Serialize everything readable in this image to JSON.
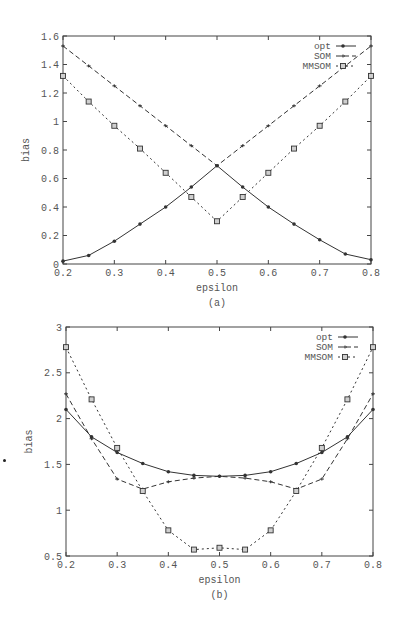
{
  "chart_data": [
    {
      "type": "line",
      "panel": "a",
      "caption": "(a)",
      "title": "",
      "xlabel": "epsilon",
      "ylabel": "bias",
      "xlim": [
        0.2,
        0.8
      ],
      "ylim": [
        0,
        1.6
      ],
      "xticks": [
        0.2,
        0.3,
        0.4,
        0.5,
        0.6,
        0.7,
        0.8
      ],
      "xtick_labels": [
        "0.2",
        "0.3",
        "0.4",
        "0.5",
        "0.6",
        "0.7",
        "0.8"
      ],
      "yticks": [
        0,
        0.2,
        0.4,
        0.6,
        0.8,
        1,
        1.2,
        1.4,
        1.6
      ],
      "ytick_labels": [
        "0",
        "0.2",
        "0.4",
        "0.6",
        "0.8",
        "1",
        "1.2",
        "1.4",
        "1.6"
      ],
      "grid": false,
      "legend_position": "upper right",
      "frame": {
        "left": 63,
        "right": 371,
        "top": 36,
        "bottom": 264
      },
      "x": [
        0.2,
        0.25,
        0.3,
        0.35,
        0.4,
        0.45,
        0.5,
        0.55,
        0.6,
        0.65,
        0.7,
        0.75,
        0.8
      ],
      "series": [
        {
          "name": "opt",
          "style": "solid",
          "marker": "dot",
          "values": [
            0.02,
            0.06,
            0.16,
            0.28,
            0.4,
            0.54,
            0.69,
            0.54,
            0.4,
            0.28,
            0.17,
            0.07,
            0.03
          ]
        },
        {
          "name": "SOM",
          "style": "dashed",
          "marker": "plus",
          "values": [
            1.53,
            1.39,
            1.25,
            1.11,
            0.97,
            0.83,
            0.69,
            0.83,
            0.97,
            1.11,
            1.25,
            1.39,
            1.53
          ]
        },
        {
          "name": "MMSOM",
          "style": "dotted",
          "marker": "square",
          "values": [
            1.32,
            1.14,
            0.97,
            0.81,
            0.64,
            0.47,
            0.3,
            0.47,
            0.64,
            0.81,
            0.97,
            1.14,
            1.32
          ]
        }
      ]
    },
    {
      "type": "line",
      "panel": "b",
      "caption": "(b)",
      "title": "",
      "xlabel": "epsilon",
      "ylabel": "bias",
      "xlim": [
        0.2,
        0.8
      ],
      "ylim": [
        0.5,
        3
      ],
      "xticks": [
        0.2,
        0.3,
        0.4,
        0.5,
        0.6,
        0.7,
        0.8
      ],
      "xtick_labels": [
        "0.2",
        "0.3",
        "0.4",
        "0.5",
        "0.6",
        "0.7",
        "0.8"
      ],
      "yticks": [
        0.5,
        1,
        1.5,
        2,
        2.5,
        3
      ],
      "ytick_labels": [
        "0.5",
        "1",
        "1.5",
        "2",
        "2.5",
        "3"
      ],
      "grid": false,
      "legend_position": "upper right",
      "frame": {
        "left": 66,
        "right": 373,
        "top": 327,
        "bottom": 556
      },
      "x": [
        0.2,
        0.25,
        0.3,
        0.35,
        0.4,
        0.45,
        0.5,
        0.55,
        0.6,
        0.65,
        0.7,
        0.75,
        0.8
      ],
      "series": [
        {
          "name": "opt",
          "style": "solid",
          "marker": "dot",
          "values": [
            2.1,
            1.8,
            1.63,
            1.51,
            1.42,
            1.38,
            1.37,
            1.38,
            1.42,
            1.51,
            1.63,
            1.8,
            2.1
          ]
        },
        {
          "name": "SOM",
          "style": "dashed",
          "marker": "plus",
          "values": [
            2.27,
            1.78,
            1.34,
            1.23,
            1.31,
            1.35,
            1.37,
            1.35,
            1.31,
            1.23,
            1.34,
            1.78,
            2.27
          ]
        },
        {
          "name": "MMSOM",
          "style": "dotted",
          "marker": "square",
          "values": [
            2.78,
            2.21,
            1.68,
            1.21,
            0.78,
            0.57,
            0.59,
            0.57,
            0.78,
            1.21,
            1.68,
            2.21,
            2.78
          ]
        }
      ]
    }
  ],
  "colors": {
    "line": "#333333",
    "axis": "#444444",
    "text": "#555555",
    "background": "#ffffff"
  }
}
